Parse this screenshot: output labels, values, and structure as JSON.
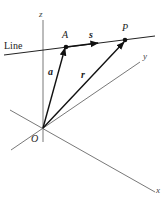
{
  "diagram": {
    "type": "vector-line-3d",
    "line_label": "Line",
    "axes": {
      "x_label": "x",
      "y_label": "y",
      "z_label": "z",
      "origin_label": "O"
    },
    "points": {
      "A_label": "A",
      "P_label": "P"
    },
    "vectors": {
      "a_label": "a",
      "r_label": "r",
      "s_label": "s"
    },
    "colors": {
      "axis": "#555555",
      "vector": "#111111",
      "line": "#222222"
    }
  }
}
